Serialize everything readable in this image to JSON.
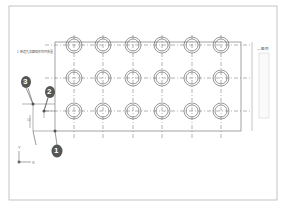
{
  "drawing": {
    "title_note": "1 新建孔及圆 矩形阵列布置",
    "legend_label": "— 图 例",
    "axis_x_label": "X",
    "axis_y_label": "Y",
    "dimension_text": "10",
    "callouts": [
      {
        "number": "1",
        "x": 36,
        "y": 150
      },
      {
        "number": "2",
        "x": 49,
        "y": 90
      },
      {
        "number": "3",
        "x": 24,
        "y": 84
      }
    ],
    "grid": {
      "columns_x": [
        74,
        103,
        133,
        162,
        192,
        221
      ],
      "rows_y": [
        45,
        78,
        111
      ],
      "outer_radius": 8,
      "inner_radius": 6
    },
    "colors": {
      "line": "#555555",
      "frame": "#aaaaaa",
      "callout_fill": "#555555",
      "callout_text": "#ffffff"
    }
  }
}
